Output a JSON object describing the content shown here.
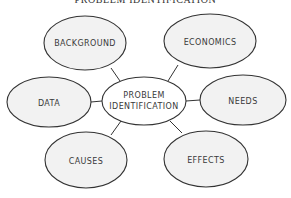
{
  "title": "PROBLEM IDENTIFICATION",
  "colors": {
    "node_fill": "#f2f2f2",
    "stroke": "#333333",
    "text": "#3a3a3a",
    "background": "#ffffff"
  },
  "center": {
    "line1": "PROBLEM",
    "line2": "IDENTIFICATION"
  },
  "nodes": [
    {
      "id": "background",
      "label": "BACKGROUND"
    },
    {
      "id": "economics",
      "label": "ECONOMICS"
    },
    {
      "id": "data",
      "label": "DATA"
    },
    {
      "id": "needs",
      "label": "NEEDS"
    },
    {
      "id": "causes",
      "label": "CAUSES"
    },
    {
      "id": "effects",
      "label": "EFFECTS"
    }
  ]
}
